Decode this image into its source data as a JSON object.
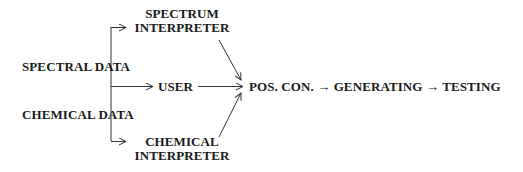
{
  "diagram": {
    "sources": {
      "spectral_data": "SPECTRAL DATA",
      "chemical_data": "CHEMICAL DATA"
    },
    "interpreters": {
      "spectrum_line1": "SPECTRUM",
      "spectrum_line2": "INTERPRETER",
      "user": "USER",
      "chemical_line1": "CHEMICAL",
      "chemical_line2": "INTERPRETER"
    },
    "pipeline": {
      "pos_con": "POS. CON.",
      "arrow1": "→",
      "generating": "GENERATING",
      "arrow2": "→",
      "testing": "TESTING"
    },
    "edges": [
      {
        "from": "SPECTRAL DATA",
        "to": "SPECTRUM INTERPRETER"
      },
      {
        "from": "SPECTRAL DATA / CHEMICAL DATA",
        "to": "USER"
      },
      {
        "from": "CHEMICAL DATA",
        "to": "CHEMICAL INTERPRETER"
      },
      {
        "from": "SPECTRUM INTERPRETER",
        "to": "POS. CON."
      },
      {
        "from": "USER",
        "to": "POS. CON."
      },
      {
        "from": "CHEMICAL INTERPRETER",
        "to": "POS. CON."
      },
      {
        "from": "POS. CON.",
        "to": "GENERATING"
      },
      {
        "from": "GENERATING",
        "to": "TESTING"
      }
    ],
    "line_color": "#333333"
  }
}
